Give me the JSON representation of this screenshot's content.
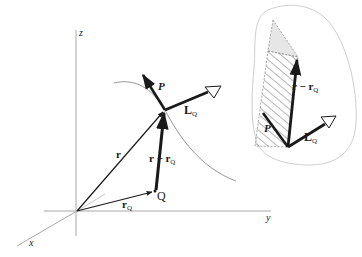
{
  "figure": {
    "axes": {
      "z_label": "z",
      "y_label": "y",
      "x_label": "x"
    },
    "main": {
      "vector_r": "r",
      "vector_rQ": "r",
      "vector_rQ_sub": "Q",
      "vector_r_minus_rQ": "r − r",
      "vector_r_minus_rQ_sub": "Q",
      "point_Q": "Q",
      "vector_P": "P",
      "vector_LQ": "L",
      "vector_LQ_sub": "Q"
    },
    "inset": {
      "vector_r_minus_rQ": "r − r",
      "vector_r_minus_rQ_sub": "Q",
      "vector_P": "P",
      "vector_LQ": "L",
      "vector_LQ_sub": "Q"
    },
    "colors": {
      "ink": "#1a1a1a",
      "axis": "#a8a8a8",
      "curve": "#8c8c8c",
      "blob_outline": "#c8c8c8",
      "shade": "#e6e6e6",
      "hatch": "#707070"
    }
  }
}
